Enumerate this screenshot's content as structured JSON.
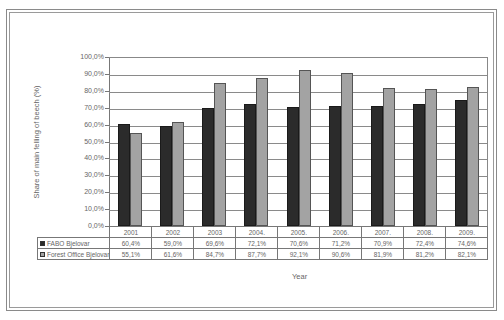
{
  "chart_data": {
    "type": "bar",
    "title": "",
    "xlabel": "Year",
    "ylabel": "Share of main felling of beech (%)",
    "ylim": [
      0,
      100
    ],
    "y_ticks": [
      "0,0%",
      "10,0%",
      "20,0%",
      "30,0%",
      "40,0%",
      "50,0%",
      "60,0%",
      "70,0%",
      "80,0%",
      "90,0%",
      "100,0%"
    ],
    "grid": true,
    "legend_position": "data table (bottom)",
    "categories": [
      "2001",
      "2002",
      "2003",
      "2004.",
      "2005.",
      "2006.",
      "2007.",
      "2008.",
      "2009."
    ],
    "series": [
      {
        "name": "FABO Bjelovar",
        "color": "#2b2b2b",
        "values": [
          60.4,
          59.0,
          69.6,
          72.1,
          70.6,
          71.2,
          70.9,
          72.4,
          74.6
        ],
        "labels": [
          "60,4%",
          "59,0%",
          "69,6%",
          "72,1%",
          "70,6%",
          "71,2%",
          "70,9%",
          "72,4%",
          "74,6%"
        ]
      },
      {
        "name": "Forest Office Bjelovar",
        "color": "#a3a3a3",
        "values": [
          55.1,
          61.6,
          84.7,
          87.7,
          92.1,
          90.6,
          81.9,
          81.2,
          82.1
        ],
        "labels": [
          "55,1%",
          "61,6%",
          "84,7%",
          "87,7%",
          "92,1%",
          "90,6%",
          "81,9%",
          "81,2%",
          "82,1%"
        ]
      }
    ]
  }
}
